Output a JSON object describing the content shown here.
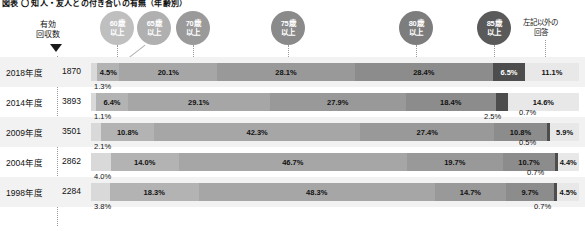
{
  "title": "図表 〇 知人・友人との付き合いの有無（年齢別）",
  "header": {
    "bubbles": [
      {
        "name": "bubble-60",
        "line1": "60歳",
        "line2": "以上"
      },
      {
        "name": "bubble-65",
        "line1": "65歳",
        "line2": "以上"
      },
      {
        "name": "bubble-70",
        "line1": "70歳",
        "line2": "以上"
      },
      {
        "name": "bubble-75",
        "line1": "75歳",
        "line2": "以上"
      },
      {
        "name": "bubble-80",
        "line1": "80歳",
        "line2": "以上"
      },
      {
        "name": "bubble-85",
        "line1": "85歳",
        "line2": "以上"
      }
    ],
    "right_legend_line1": "左記以外の",
    "right_legend_line2": "回答"
  },
  "axis": {
    "note_line1": "有効",
    "note_line2": "回収数"
  },
  "chart_data": {
    "type": "bar",
    "subtype": "stacked-horizontal-100pct",
    "title": "図表 〇 知人・友人との付き合いの有無（年齢別）",
    "xlabel": "",
    "ylabel": "",
    "xlim": [
      0,
      100
    ],
    "grid": false,
    "legend_position": "top",
    "categories": [
      "2018年度",
      "2014年度",
      "2009年度",
      "2004年度",
      "1998年度"
    ],
    "sample_sizes": [
      1870,
      3893,
      3501,
      2862,
      2284
    ],
    "series": [
      {
        "name": "未満（最左）",
        "label": "",
        "values": [
          1.3,
          1.1,
          2.1,
          4.0,
          3.8
        ]
      },
      {
        "name": "60歳以上",
        "label": "60歳以上",
        "values": [
          4.5,
          6.4,
          10.8,
          14.0,
          18.3
        ]
      },
      {
        "name": "65歳以上",
        "label": "65歳以上",
        "values": [
          20.1,
          29.1,
          42.3,
          46.7,
          48.3
        ]
      },
      {
        "name": "70歳以上",
        "label": "70歳以上",
        "values": [
          28.1,
          27.9,
          27.4,
          19.7,
          14.7
        ]
      },
      {
        "name": "75歳以上",
        "label": "75歳以上",
        "values": [
          28.4,
          18.4,
          10.8,
          10.7,
          9.7
        ]
      },
      {
        "name": "80歳以上",
        "label": "80歳以上",
        "values": [
          6.5,
          2.5,
          0.7,
          0.5,
          0.7
        ]
      },
      {
        "name": "85歳以上",
        "label": "85歳以上",
        "values": [
          0.0,
          0.0,
          0.0,
          0.0,
          0.0
        ]
      },
      {
        "name": "左記以外の回答",
        "label": "左記以外の回答",
        "values": [
          11.1,
          14.6,
          5.9,
          4.4,
          4.5
        ]
      }
    ]
  },
  "rows": [
    {
      "year": "2018年度",
      "n": "1870",
      "segments": [
        {
          "name": "seg-pre",
          "value": 1.3,
          "label": "1.3%",
          "color": "#d9d9d9",
          "text": "#111111",
          "inside": false,
          "callout": "below-left"
        },
        {
          "name": "seg-60",
          "value": 4.5,
          "label": "4.5%",
          "color": "#b3b3b3",
          "text": "#111111",
          "inside": true
        },
        {
          "name": "seg-65",
          "value": 20.1,
          "label": "20.1%",
          "color": "#a6a6a6",
          "text": "#111111",
          "inside": true
        },
        {
          "name": "seg-70",
          "value": 28.1,
          "label": "28.1%",
          "color": "#999999",
          "text": "#111111",
          "inside": true
        },
        {
          "name": "seg-75",
          "value": 28.4,
          "label": "28.4%",
          "color": "#8c8c8c",
          "text": "#111111",
          "inside": true
        },
        {
          "name": "seg-80",
          "value": 6.5,
          "label": "6.5%",
          "color": "#4d4d4d",
          "text": "#ffffff",
          "inside": true
        },
        {
          "name": "seg-other",
          "value": 11.1,
          "label": "11.1%",
          "color": "#e8e8e8",
          "text": "#111111",
          "inside": true
        }
      ]
    },
    {
      "year": "2014年度",
      "n": "3893",
      "segments": [
        {
          "name": "seg-pre",
          "value": 1.1,
          "label": "1.1%",
          "color": "#d9d9d9",
          "text": "#111111",
          "inside": false,
          "callout": "below-left"
        },
        {
          "name": "seg-60",
          "value": 6.4,
          "label": "6.4%",
          "color": "#b3b3b3",
          "text": "#111111",
          "inside": true
        },
        {
          "name": "seg-65",
          "value": 29.1,
          "label": "29.1%",
          "color": "#a6a6a6",
          "text": "#111111",
          "inside": true
        },
        {
          "name": "seg-70",
          "value": 27.9,
          "label": "27.9%",
          "color": "#999999",
          "text": "#111111",
          "inside": true
        },
        {
          "name": "seg-75",
          "value": 18.4,
          "label": "18.4%",
          "color": "#8c8c8c",
          "text": "#111111",
          "inside": true
        },
        {
          "name": "seg-80",
          "value": 2.5,
          "label": "2.5%",
          "color": "#4d4d4d",
          "text": "#ffffff",
          "inside": false,
          "callout": "below-right"
        },
        {
          "name": "seg-other",
          "value": 14.6,
          "label": "14.6%",
          "color": "#e8e8e8",
          "text": "#111111",
          "inside": true
        }
      ]
    },
    {
      "year": "2009年度",
      "n": "3501",
      "segments": [
        {
          "name": "seg-pre",
          "value": 2.1,
          "label": "2.1%",
          "color": "#d9d9d9",
          "text": "#111111",
          "inside": false,
          "callout": "below-left"
        },
        {
          "name": "seg-60",
          "value": 10.8,
          "label": "10.8%",
          "color": "#b3b3b3",
          "text": "#111111",
          "inside": true
        },
        {
          "name": "seg-65",
          "value": 42.3,
          "label": "42.3%",
          "color": "#a6a6a6",
          "text": "#111111",
          "inside": true
        },
        {
          "name": "seg-70",
          "value": 27.4,
          "label": "27.4%",
          "color": "#999999",
          "text": "#111111",
          "inside": true
        },
        {
          "name": "seg-75",
          "value": 10.8,
          "label": "10.8%",
          "color": "#8c8c8c",
          "text": "#111111",
          "inside": true
        },
        {
          "name": "seg-80",
          "value": 0.7,
          "label": "0.7%",
          "color": "#4d4d4d",
          "text": "#ffffff",
          "inside": false,
          "callout": "below-right"
        },
        {
          "name": "seg-other",
          "value": 5.9,
          "label": "5.9%",
          "color": "#e8e8e8",
          "text": "#111111",
          "inside": true
        }
      ]
    },
    {
      "year": "2004年度",
      "n": "2862",
      "segments": [
        {
          "name": "seg-pre",
          "value": 4.0,
          "label": "4.0%",
          "color": "#d9d9d9",
          "text": "#111111",
          "inside": false,
          "callout": "below-left"
        },
        {
          "name": "seg-60",
          "value": 14.0,
          "label": "14.0%",
          "color": "#b3b3b3",
          "text": "#111111",
          "inside": true
        },
        {
          "name": "seg-65",
          "value": 46.7,
          "label": "46.7%",
          "color": "#a6a6a6",
          "text": "#111111",
          "inside": true
        },
        {
          "name": "seg-70",
          "value": 19.7,
          "label": "19.7%",
          "color": "#999999",
          "text": "#111111",
          "inside": true
        },
        {
          "name": "seg-75",
          "value": 10.7,
          "label": "10.7%",
          "color": "#8c8c8c",
          "text": "#111111",
          "inside": true
        },
        {
          "name": "seg-80",
          "value": 0.5,
          "label": "0.5%",
          "color": "#4d4d4d",
          "text": "#ffffff",
          "inside": false,
          "callout": "below-right"
        },
        {
          "name": "seg-other",
          "value": 4.4,
          "label": "4.4%",
          "color": "#e8e8e8",
          "text": "#111111",
          "inside": true
        }
      ]
    },
    {
      "year": "1998年度",
      "n": "2284",
      "segments": [
        {
          "name": "seg-pre",
          "value": 3.8,
          "label": "3.8%",
          "color": "#d9d9d9",
          "text": "#111111",
          "inside": false,
          "callout": "below-left"
        },
        {
          "name": "seg-60",
          "value": 18.3,
          "label": "18.3%",
          "color": "#b3b3b3",
          "text": "#111111",
          "inside": true
        },
        {
          "name": "seg-65",
          "value": 48.3,
          "label": "48.3%",
          "color": "#a6a6a6",
          "text": "#111111",
          "inside": true
        },
        {
          "name": "seg-70",
          "value": 14.7,
          "label": "14.7%",
          "color": "#999999",
          "text": "#111111",
          "inside": true
        },
        {
          "name": "seg-75",
          "value": 9.7,
          "label": "9.7%",
          "color": "#8c8c8c",
          "text": "#111111",
          "inside": true
        },
        {
          "name": "seg-80",
          "value": 0.7,
          "label": "0.7%",
          "color": "#4d4d4d",
          "text": "#ffffff",
          "inside": false,
          "callout": "below-right"
        },
        {
          "name": "seg-other",
          "value": 4.5,
          "label": "4.5%",
          "color": "#e8e8e8",
          "text": "#111111",
          "inside": true
        }
      ]
    }
  ],
  "callouts": [
    {
      "name": "callout-2018-pre",
      "text": "1.3%",
      "x": 96,
      "y": 82
    },
    {
      "name": "callout-2014-pre",
      "text": "1.1%",
      "x": 96,
      "y": 112
    },
    {
      "name": "callout-2014-80",
      "text": "2.5%",
      "x": 486,
      "y": 112
    },
    {
      "name": "callout-2009-pre",
      "text": "2.1%",
      "x": 96,
      "y": 142
    },
    {
      "name": "callout-2009-80",
      "text": "0.7%",
      "x": 526,
      "y": 142
    },
    {
      "name": "callout-2004-pre",
      "text": "4.0%",
      "x": 96,
      "y": 172
    },
    {
      "name": "callout-2004-80",
      "text": "0.7%",
      "x": 524,
      "y": 142
    },
    {
      "name": "callout-1998-pre",
      "text": "3.8%",
      "x": 96,
      "y": 212
    },
    {
      "name": "callout-1998-80",
      "text": "0.7%",
      "x": 534,
      "y": 212
    }
  ],
  "extra_callouts": [
    {
      "name": "callout-2004-above",
      "text": "0.7%",
      "x": 527,
      "y": 142
    },
    {
      "name": "callout-1998-above",
      "text": "0.5%",
      "x": 533,
      "y": 172
    }
  ],
  "colors": {
    "bubble_60": "#bfbfbf",
    "bubble_65": "#b0b0b0",
    "bubble_70": "#9a9a9a",
    "bubble_75": "#8a8a8a",
    "bubble_80": "#7d7d7d",
    "bubble_85": "#5a5a5a",
    "row_alt_bg": "#f2f2f2"
  }
}
